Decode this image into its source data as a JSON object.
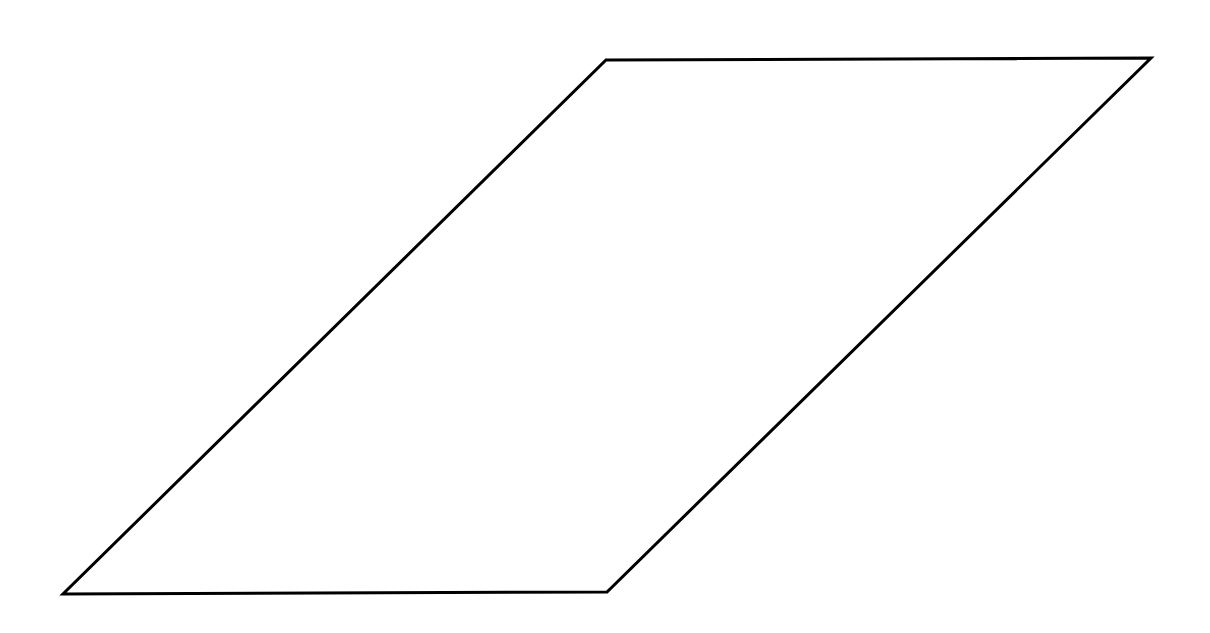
{
  "diagram": {
    "shape": "parallelogram",
    "stroke_color": "#000000",
    "fill_color": "#ffffff",
    "stroke_width": 3,
    "vertices": {
      "top_left": [
        606,
        60
      ],
      "top_right": [
        1151,
        58
      ],
      "bottom_right": [
        607,
        592
      ],
      "bottom_left": [
        63,
        594
      ]
    },
    "points": "606,60 1151,58 607,592 63,594"
  }
}
